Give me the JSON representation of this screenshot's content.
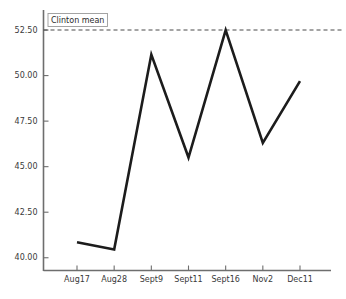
{
  "chart_data": {
    "type": "line",
    "title": "",
    "xlabel": "",
    "ylabel": "",
    "categories": [
      "Aug17",
      "Aug28",
      "Sept9",
      "Sept11",
      "Sept16",
      "Nov2",
      "Dec11"
    ],
    "values": [
      40.85,
      40.45,
      51.15,
      45.5,
      52.5,
      46.3,
      49.7
    ],
    "series": [
      {
        "name": "poll series",
        "values": [
          40.85,
          40.45,
          51.15,
          45.5,
          52.5,
          46.3,
          49.7
        ],
        "color": "#1c1c1c"
      }
    ],
    "ylim": [
      39.3,
      53.6
    ],
    "yticks": [
      40.0,
      42.5,
      45.0,
      47.5,
      50.0,
      52.5
    ],
    "ytick_labels": [
      "40.00",
      "42.50",
      "45.00",
      "47.50",
      "50.00",
      "52.50"
    ],
    "grid": false,
    "legend": "none",
    "reference_lines": [
      {
        "label": "Clinton mean",
        "value": 52.5,
        "style": "dashed",
        "color": "#4a4a4a"
      }
    ],
    "annotations": [
      {
        "text": "Clinton mean",
        "boxed": true,
        "x_category": "Aug17",
        "y_value": 53.05
      }
    ]
  },
  "colors": {
    "series": "#1c1c1c",
    "axis": "#6e6e6e",
    "reference": "#4a4a4a",
    "text": "#3a3a3a",
    "background": "#ffffff"
  }
}
